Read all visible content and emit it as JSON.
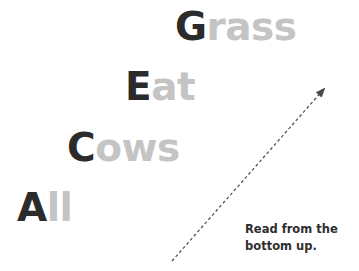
{
  "diagram": {
    "words": [
      {
        "initial": "G",
        "rest": "rass",
        "left": 175,
        "top": 7
      },
      {
        "initial": "E",
        "rest": "at",
        "left": 125,
        "top": 67
      },
      {
        "initial": "C",
        "rest": "ows",
        "left": 67,
        "top": 128
      },
      {
        "initial": "A",
        "rest": "ll",
        "left": 17,
        "top": 188
      }
    ],
    "caption": {
      "line1": "Read from the",
      "line2": "bottom up."
    },
    "arrow": {
      "icon": "dashed-arrow-up-right-icon",
      "from": [
        172,
        261
      ],
      "to": [
        325,
        88
      ],
      "color": "#555555"
    },
    "colors": {
      "initial": "#2b2b2b",
      "rest": "#c4c4c4",
      "caption": "#2e2e2e"
    }
  }
}
